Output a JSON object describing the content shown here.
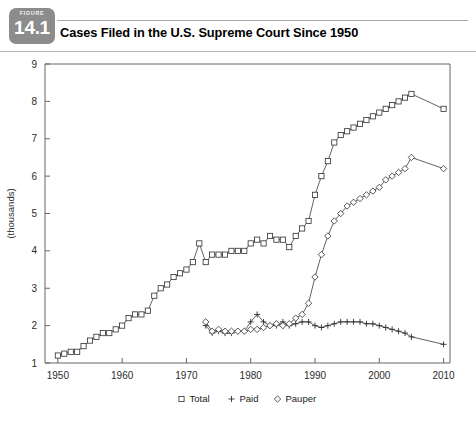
{
  "figure": {
    "label": "FIGURE",
    "number": "14.1"
  },
  "header": {
    "title": "Cases Filed in the U.S. Supreme Court Since 1950"
  },
  "chart_data": {
    "type": "line",
    "title": "Cases Filed in the U.S. Supreme Court Since 1950",
    "xlabel": "",
    "ylabel": "(thousands)",
    "xlim": [
      1948,
      2011
    ],
    "ylim": [
      1,
      9
    ],
    "xticks": [
      1950,
      1960,
      1970,
      1980,
      1990,
      2000,
      2010
    ],
    "xtick_labels": [
      "1950",
      "1960",
      "1970",
      "1980",
      "1990",
      "2000",
      "2010"
    ],
    "yticks": [
      1,
      2,
      3,
      4,
      5,
      6,
      7,
      8,
      9
    ],
    "ytick_labels": [
      "1",
      "2",
      "3",
      "4",
      "5",
      "6",
      "7",
      "8",
      "9"
    ],
    "grid": false,
    "legend_position": "bottom",
    "series": [
      {
        "name": "Total",
        "marker": "square",
        "x": [
          1950,
          1951,
          1952,
          1953,
          1954,
          1955,
          1956,
          1957,
          1958,
          1959,
          1960,
          1961,
          1962,
          1963,
          1964,
          1965,
          1966,
          1967,
          1968,
          1969,
          1970,
          1971,
          1972,
          1973,
          1974,
          1975,
          1976,
          1977,
          1978,
          1979,
          1980,
          1981,
          1982,
          1983,
          1984,
          1985,
          1986,
          1987,
          1988,
          1989,
          1990,
          1991,
          1992,
          1993,
          1994,
          1995,
          1996,
          1997,
          1998,
          1999,
          2000,
          2001,
          2002,
          2003,
          2004,
          2005,
          2010
        ],
        "values": [
          1.2,
          1.25,
          1.3,
          1.3,
          1.45,
          1.6,
          1.7,
          1.8,
          1.8,
          1.9,
          2.0,
          2.2,
          2.3,
          2.3,
          2.4,
          2.8,
          3.0,
          3.1,
          3.3,
          3.4,
          3.5,
          3.7,
          4.2,
          3.7,
          3.9,
          3.9,
          3.9,
          4.0,
          4.0,
          4.0,
          4.2,
          4.3,
          4.2,
          4.4,
          4.3,
          4.3,
          4.1,
          4.4,
          4.6,
          4.8,
          5.5,
          6.0,
          6.4,
          6.9,
          7.1,
          7.2,
          7.3,
          7.4,
          7.5,
          7.6,
          7.7,
          7.8,
          7.9,
          8.0,
          8.1,
          8.2,
          7.8
        ]
      },
      {
        "name": "Paid",
        "marker": "plus",
        "x": [
          1973,
          1974,
          1975,
          1976,
          1977,
          1978,
          1979,
          1980,
          1981,
          1982,
          1983,
          1984,
          1985,
          1986,
          1987,
          1988,
          1989,
          1990,
          1991,
          1992,
          1993,
          1994,
          1995,
          1996,
          1997,
          1998,
          1999,
          2000,
          2001,
          2002,
          2003,
          2004,
          2005,
          2010
        ],
        "values": [
          2.0,
          1.8,
          1.85,
          1.8,
          1.8,
          1.85,
          1.85,
          2.1,
          2.3,
          2.1,
          2.0,
          2.0,
          2.1,
          2.0,
          2.05,
          2.1,
          2.1,
          2.0,
          1.95,
          2.0,
          2.05,
          2.1,
          2.1,
          2.1,
          2.1,
          2.05,
          2.05,
          2.0,
          1.95,
          1.9,
          1.85,
          1.8,
          1.7,
          1.5
        ]
      },
      {
        "name": "Pauper",
        "marker": "diamond",
        "x": [
          1973,
          1974,
          1975,
          1976,
          1977,
          1978,
          1979,
          1980,
          1981,
          1982,
          1983,
          1984,
          1985,
          1986,
          1987,
          1988,
          1989,
          1990,
          1991,
          1992,
          1993,
          1994,
          1995,
          1996,
          1997,
          1998,
          1999,
          2000,
          2001,
          2002,
          2003,
          2004,
          2005,
          2010
        ],
        "values": [
          2.1,
          1.85,
          1.9,
          1.85,
          1.85,
          1.85,
          1.85,
          1.9,
          1.9,
          1.95,
          2.0,
          2.05,
          2.0,
          2.05,
          2.2,
          2.3,
          2.6,
          3.3,
          3.9,
          4.4,
          4.8,
          5.0,
          5.2,
          5.3,
          5.4,
          5.5,
          5.6,
          5.7,
          5.9,
          6.0,
          6.1,
          6.2,
          6.5,
          6.2
        ]
      }
    ],
    "legend": [
      {
        "label": "Total",
        "marker": "square"
      },
      {
        "label": "Paid",
        "marker": "plus"
      },
      {
        "label": "Pauper",
        "marker": "diamond"
      }
    ]
  },
  "colors": {
    "badge": "#8c8c8c",
    "line": "#3a3a3a",
    "axis": "#666666",
    "text": "#000000"
  }
}
